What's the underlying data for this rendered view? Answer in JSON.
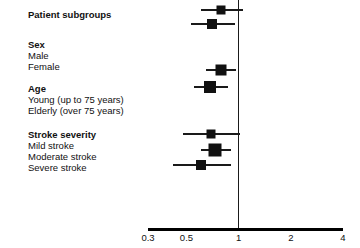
{
  "chart_data": {
    "type": "forest",
    "title": "",
    "xlabel": "",
    "ylabel": "",
    "scale": "log",
    "xlim": [
      0.3,
      4
    ],
    "ticks": [
      {
        "label": "0.3",
        "value": 0.3
      },
      {
        "label": "0.5",
        "value": 0.5
      },
      {
        "label": "1",
        "value": 1
      },
      {
        "label": "2",
        "value": 2
      },
      {
        "label": "4",
        "value": 4
      }
    ],
    "reference_line": 1,
    "grid": false,
    "legend": "none",
    "row_header": "Patient subgroups",
    "rows": [
      {
        "label": "Patient subgroups",
        "type": "overall",
        "bold": true,
        "estimate": 0.79,
        "ci_low": 0.61,
        "ci_high": 1.06,
        "marker_size": 9
      },
      {
        "label": "Sex",
        "type": "heading",
        "bold": true
      },
      {
        "label": "Male",
        "type": "data",
        "bold": false,
        "estimate": 0.7,
        "ci_low": 0.53,
        "ci_high": 0.95,
        "marker_size": 10
      },
      {
        "label": "Female",
        "type": "data",
        "bold": false
      },
      {
        "label": "Age",
        "type": "heading",
        "bold": true
      },
      {
        "label": "Young (up to 75 years)",
        "type": "data",
        "bold": false,
        "estimate": 0.79,
        "ci_low": 0.65,
        "ci_high": 0.96,
        "marker_size": 11
      },
      {
        "label": "Elderly (over 75 years)",
        "type": "data",
        "bold": false,
        "estimate": 0.68,
        "ci_low": 0.55,
        "ci_high": 0.87,
        "marker_size": 12
      },
      {
        "label": "Stroke severity",
        "type": "heading",
        "bold": true
      },
      {
        "label": "Mild stroke",
        "type": "data",
        "bold": false,
        "estimate": 0.69,
        "ci_low": 0.48,
        "ci_high": 1.02,
        "marker_size": 9
      },
      {
        "label": "Moderate stroke",
        "type": "data",
        "bold": false,
        "estimate": 0.73,
        "ci_low": 0.61,
        "ci_high": 0.9,
        "marker_size": 13
      },
      {
        "label": "Severe stroke",
        "type": "data",
        "bold": false,
        "estimate": 0.61,
        "ci_low": 0.42,
        "ci_high": 0.9,
        "marker_size": 10
      }
    ]
  },
  "layout": {
    "label_x": 28,
    "axis_left_px": 148,
    "axis_right_px": 343,
    "axis_y_px": 228,
    "vref_top_px": 0,
    "row_y_px": [
      10,
      40,
      51,
      62,
      84,
      95,
      106,
      130,
      141,
      152,
      163
    ],
    "marker_y_px": [
      10,
      0,
      24,
      0,
      0,
      70,
      87,
      0,
      134,
      150,
      165
    ]
  }
}
